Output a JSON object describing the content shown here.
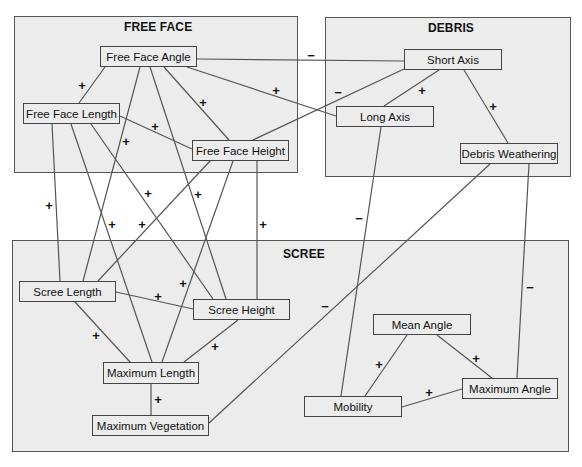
{
  "regions": {
    "free_face": {
      "title": "FREE FACE"
    },
    "debris": {
      "title": "DEBRIS"
    },
    "scree": {
      "title": "SCREE"
    }
  },
  "nodes": {
    "free_face_angle": "Free Face Angle",
    "free_face_length": "Free Face Length",
    "free_face_height": "Free Face Height",
    "short_axis": "Short Axis",
    "long_axis": "Long Axis",
    "debris_weathering": "Debris Weathering",
    "scree_length": "Scree Length",
    "scree_height": "Scree Height",
    "maximum_length": "Maximum Length",
    "maximum_vegetation": "Maximum Vegetation",
    "mean_angle": "Mean Angle",
    "maximum_angle": "Maximum Angle",
    "mobility": "Mobility"
  },
  "signs": {
    "ffa_sa": "−",
    "ffa_ffl": "+",
    "ffa_ffh": "+",
    "ffa_la": "+",
    "ffl_ffh": "+",
    "ffa_sl": "+",
    "sa_ffh": "−",
    "sa_la": "+",
    "sa_dw": "+",
    "ffl_sl": "+",
    "ffl_ml": "+",
    "ffh_sl": "+",
    "ffl_sh": "+",
    "ffa_sh": "+",
    "ffh_ml": "+",
    "ffh_sh": "+",
    "la_mob": "−",
    "dw_mv": "−",
    "dw_maxa": "−",
    "sl_sh": "+",
    "sl_ml": "+",
    "sh_ml": "+",
    "ml_mv": "+",
    "mean_mob": "+",
    "mean_maxa": "+",
    "mob_maxa": "+"
  }
}
